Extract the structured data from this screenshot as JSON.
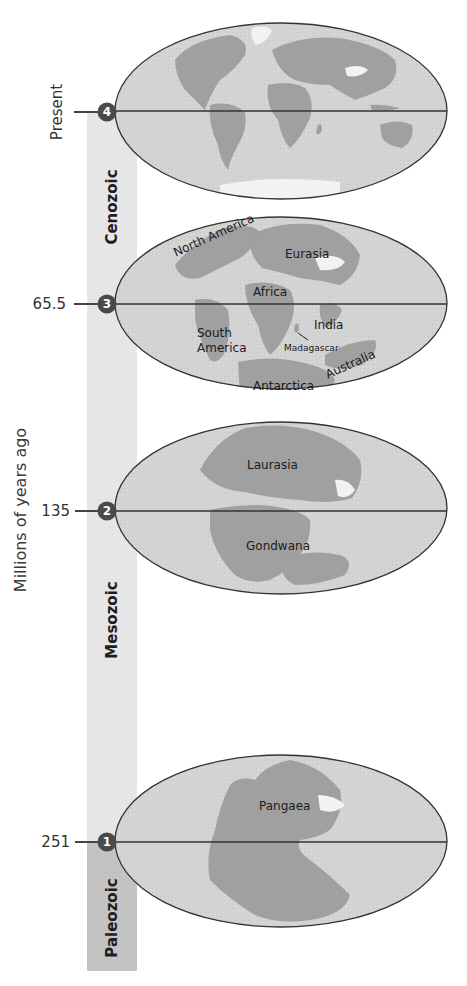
{
  "axis": {
    "title": "Millions of years ago",
    "ticks": [
      {
        "label": "Present",
        "marker": "4"
      },
      {
        "label": "65.5",
        "marker": "3"
      },
      {
        "label": "135",
        "marker": "2"
      },
      {
        "label": "251",
        "marker": "1"
      }
    ]
  },
  "eras": [
    {
      "name": "Cenozoic"
    },
    {
      "name": "Mesozoic"
    },
    {
      "name": "Paleozoic"
    }
  ],
  "maps": [
    {
      "id": "present",
      "marker": "4",
      "labels": []
    },
    {
      "id": "65.5",
      "marker": "3",
      "labels": [
        "North America",
        "Eurasia",
        "Africa",
        "South America",
        "India",
        "Madagascar",
        "Australia",
        "Antarctica"
      ]
    },
    {
      "id": "135",
      "marker": "2",
      "labels": [
        "Laurasia",
        "Gondwana"
      ]
    },
    {
      "id": "251",
      "marker": "1",
      "labels": [
        "Pangaea"
      ]
    }
  ],
  "labels": {
    "south_america_line1": "South",
    "south_america_line2": "America"
  },
  "colors": {
    "ocean": "#d4d4d4",
    "land": "#9a9a9a",
    "ice": "#f4f4f4",
    "outline": "#333333",
    "marker": "#4a4a4a",
    "era_bar_light": "#e6e6e6",
    "era_bar_dark": "#c3c3c3"
  }
}
